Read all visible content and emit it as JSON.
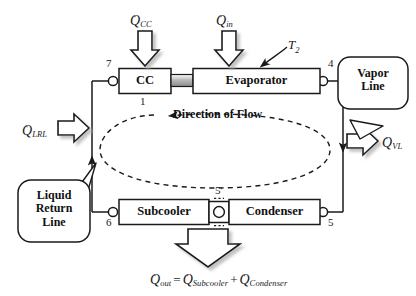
{
  "diagram": {
    "components": [
      {
        "id": "cc",
        "label": "CC"
      },
      {
        "id": "evaporator",
        "label": "Evaporator"
      },
      {
        "id": "subcooler",
        "label": "Subcooler"
      },
      {
        "id": "condenser",
        "label": "Condenser"
      }
    ],
    "nodes": [
      {
        "id": "n7",
        "label": "7"
      },
      {
        "id": "n1",
        "label": "1"
      },
      {
        "id": "n4",
        "label": "4"
      },
      {
        "id": "n5",
        "label": "5"
      },
      {
        "id": "n5p",
        "label": "5'"
      },
      {
        "id": "n6",
        "label": "6"
      }
    ],
    "callouts": [
      {
        "id": "vapor-line",
        "line1": "Vapor",
        "line2": "Line"
      },
      {
        "id": "liquid-return-line",
        "line1": "Liquid",
        "line2": "Return",
        "line3": "Line"
      }
    ],
    "flow_label": "Direction of Flow",
    "temperature_label": {
      "symbol": "T",
      "subscript": "2"
    },
    "heat_flows": [
      {
        "id": "q-cc",
        "symbol": "Q",
        "dot": "·",
        "subscript": "CC",
        "direction": "down"
      },
      {
        "id": "q-in",
        "symbol": "Q",
        "dot": "·",
        "subscript": "in",
        "direction": "down"
      },
      {
        "id": "q-lrl",
        "symbol": "Q",
        "dot": "·",
        "subscript": "LRL",
        "direction": "right"
      },
      {
        "id": "q-vl",
        "symbol": "Q",
        "dot": "·",
        "subscript": "VL",
        "direction": "right"
      },
      {
        "id": "q-out",
        "symbol": "Q",
        "dot": "·",
        "subscript": "out",
        "direction": "down"
      }
    ],
    "equation": {
      "lhs": {
        "symbol": "Q",
        "subscript": "out"
      },
      "operator_equals": "=",
      "operator_plus": "+",
      "term1": {
        "symbol": "Q",
        "subscript": "Subcooler"
      },
      "term2": {
        "symbol": "Q",
        "subscript": "Condenser"
      }
    },
    "colors": {
      "stroke": "#1a1a1a",
      "background": "#ffffff",
      "connector_gray": "#9a9a9a",
      "shadow": "#8a8a8a"
    }
  }
}
